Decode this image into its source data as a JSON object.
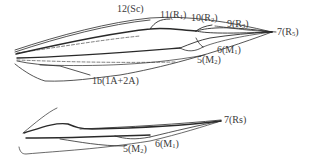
{
  "diagram": {
    "type": "insect-wing-venation",
    "colors": {
      "background": "#ffffff",
      "vein": "#2a2a2a",
      "label": "#3a3a3a"
    },
    "forewing": {
      "labels": [
        {
          "id": "sc",
          "number": "12",
          "vein": "Sc",
          "sub": "",
          "x": 118,
          "y": 10
        },
        {
          "id": "r1",
          "number": "11",
          "vein": "R",
          "sub": "1",
          "x": 160,
          "y": 10
        },
        {
          "id": "r2",
          "number": "10",
          "vein": "R",
          "sub": "2",
          "x": 191,
          "y": 13
        },
        {
          "id": "r3",
          "number": "9",
          "vein": "R",
          "sub": "3",
          "x": 227,
          "y": 19
        },
        {
          "id": "r5",
          "number": "7",
          "vein": "R",
          "sub": "5",
          "x": 277,
          "y": 28
        },
        {
          "id": "m1",
          "number": "6",
          "vein": "M",
          "sub": "1",
          "x": 217,
          "y": 46
        },
        {
          "id": "m2",
          "number": "5",
          "vein": "M",
          "sub": "2",
          "x": 197,
          "y": 56
        },
        {
          "id": "a",
          "number": "1b",
          "vein": "1A+2A",
          "sub": "",
          "x": 92,
          "y": 76
        }
      ]
    },
    "hindwing": {
      "labels": [
        {
          "id": "rs",
          "number": "7",
          "vein": "Rs",
          "sub": "",
          "x": 225,
          "y": 119
        },
        {
          "id": "m2",
          "number": "5",
          "vein": "M",
          "sub": "2",
          "x": 124,
          "y": 145
        },
        {
          "id": "m1",
          "number": "6",
          "vein": "M",
          "sub": "1",
          "x": 156,
          "y": 140
        }
      ]
    }
  }
}
